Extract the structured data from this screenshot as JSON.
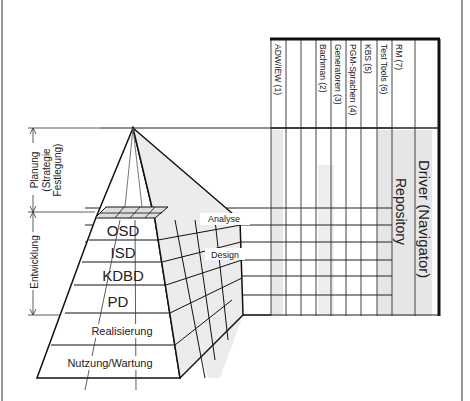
{
  "diagram": {
    "phases": {
      "planung": [
        "Planung",
        "(Strategie",
        "Festlegung)"
      ],
      "entwicklung": "Entwicklung"
    },
    "pyramid_layers": [
      "OSD",
      "ISD",
      "KDBD",
      "PD",
      "Realisierung",
      "Nutzung/Wartung"
    ],
    "callouts": [
      "Analyse",
      "Design"
    ],
    "tool_columns": [
      "ADW/IEW (1)",
      "",
      "",
      "Bachman (2)",
      "Generatoren (3)",
      "PGM-Sprachen (4)",
      "KBS (5)",
      "Test Tools (6)",
      "RM (7)"
    ],
    "side_labels": {
      "repository": "Repository",
      "driver": "Driver (Navigator)"
    }
  }
}
